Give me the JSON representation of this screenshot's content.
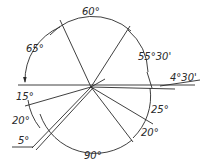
{
  "diagram": {
    "type": "angular-dimension-drawing",
    "center": [
      91,
      87
    ],
    "labels": {
      "top": "60°",
      "upper_left": "65°",
      "upper_right": "55°30'",
      "right": "4°30'",
      "left_1": "15°",
      "left_2": "20°",
      "left_3": "5°",
      "bottom": "90°",
      "lower_right_1": "25°",
      "lower_right_2": "20°"
    },
    "colors": {
      "line": "#2a2a2a",
      "background": "#ffffff"
    }
  }
}
